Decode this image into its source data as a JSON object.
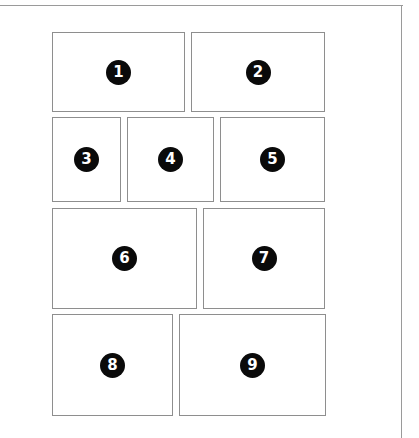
{
  "diagram": {
    "title": "",
    "type": "comic page panel layout",
    "panels": [
      {
        "number": "1",
        "row": 1
      },
      {
        "number": "2",
        "row": 1
      },
      {
        "number": "3",
        "row": 2
      },
      {
        "number": "4",
        "row": 2
      },
      {
        "number": "5",
        "row": 2
      },
      {
        "number": "6",
        "row": 3
      },
      {
        "number": "7",
        "row": 3
      },
      {
        "number": "8",
        "row": 4
      },
      {
        "number": "9",
        "row": 4
      }
    ],
    "colors": {
      "border": "#8e8e8e",
      "badge": "#0a0a0a",
      "badge_text": "#ffffff",
      "background": "#ffffff"
    }
  }
}
